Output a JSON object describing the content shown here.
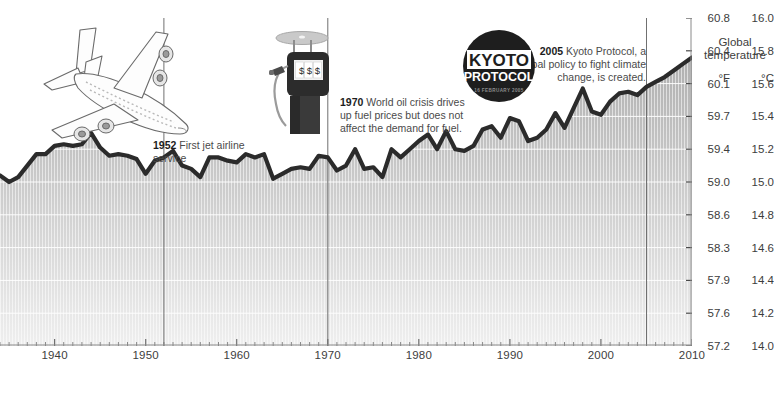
{
  "axis": {
    "header_line1": "Global",
    "header_line2": "temperature",
    "unit_f": "°F",
    "unit_c": "°C",
    "f_labels": [
      "60.8",
      "60.4",
      "60.1",
      "59.7",
      "59.4",
      "59.0",
      "58.6",
      "58.3",
      "57.9",
      "57.6",
      "57.2"
    ],
    "c_labels": [
      "16.0",
      "15.8",
      "15.6",
      "15.4",
      "15.2",
      "15.0",
      "14.8",
      "14.6",
      "14.4",
      "14.2",
      "14.0"
    ],
    "x_labels": [
      "1940",
      "1950",
      "1960",
      "1970",
      "1980",
      "1990",
      "2000",
      "2010"
    ]
  },
  "annotations": [
    {
      "id": "anno-1952",
      "year": "1952",
      "text": " First jet airline service",
      "line_x": 1952
    },
    {
      "id": "anno-1970",
      "year": "1970",
      "text": " World oil crisis drives up fuel prices but does not affect the demand for fuel.",
      "line_x": 1970
    },
    {
      "id": "anno-2005",
      "year": "2005",
      "text": " Kyoto Protocol, a global policy to fight climate change, is created.",
      "line_x": 2005
    }
  ],
  "illustrations": {
    "plane": {
      "name": "airplane-illustration",
      "alt": "jet airliner line drawing"
    },
    "pump": {
      "name": "fuel-pump-illustration",
      "display": "$ $ $"
    },
    "kyoto": {
      "name": "kyoto-protocol-stamp",
      "line1": "KYOTO",
      "line2": "PROTOCOL",
      "line3": "16 FEBRUARY 2005"
    }
  },
  "colors": {
    "line": "#2b2b2b",
    "fill_top": "#b4b4b4",
    "fill_bottom": "#ececec",
    "grid": "#ffffff",
    "callout": "#6e6e6e",
    "text": "#3d3d3d"
  },
  "chart_data": {
    "type": "area",
    "title": "Global temperature",
    "xlabel": "",
    "ylabel": "Global temperature",
    "y_unit_primary": "°F",
    "y_unit_secondary": "°C",
    "xlim": [
      1934,
      2010
    ],
    "ylim_c": [
      14.0,
      16.0
    ],
    "ylim_f": [
      57.2,
      60.8
    ],
    "grid": true,
    "legend": "none",
    "x": [
      1934,
      1935,
      1936,
      1937,
      1938,
      1939,
      1940,
      1941,
      1942,
      1943,
      1944,
      1945,
      1946,
      1947,
      1948,
      1949,
      1950,
      1951,
      1952,
      1953,
      1954,
      1955,
      1956,
      1957,
      1958,
      1959,
      1960,
      1961,
      1962,
      1963,
      1964,
      1965,
      1966,
      1967,
      1968,
      1969,
      1970,
      1971,
      1972,
      1973,
      1974,
      1975,
      1976,
      1977,
      1978,
      1979,
      1980,
      1981,
      1982,
      1983,
      1984,
      1985,
      1986,
      1987,
      1988,
      1989,
      1990,
      1991,
      1992,
      1993,
      1994,
      1995,
      1996,
      1997,
      1998,
      1999,
      2000,
      2001,
      2002,
      2003,
      2004,
      2005,
      2006,
      2007,
      2008,
      2009,
      2010
    ],
    "values_c": [
      15.04,
      15.0,
      15.03,
      15.1,
      15.17,
      15.17,
      15.22,
      15.23,
      15.22,
      15.23,
      15.3,
      15.21,
      15.16,
      15.17,
      15.16,
      15.14,
      15.05,
      15.13,
      15.15,
      15.19,
      15.1,
      15.08,
      15.03,
      15.15,
      15.15,
      15.13,
      15.12,
      15.17,
      15.15,
      15.17,
      15.02,
      15.05,
      15.08,
      15.09,
      15.08,
      15.16,
      15.15,
      15.07,
      15.1,
      15.2,
      15.08,
      15.09,
      15.03,
      15.2,
      15.15,
      15.2,
      15.25,
      15.29,
      15.2,
      15.31,
      15.2,
      15.19,
      15.22,
      15.32,
      15.34,
      15.27,
      15.39,
      15.37,
      15.25,
      15.27,
      15.32,
      15.42,
      15.33,
      15.45,
      15.57,
      15.43,
      15.41,
      15.49,
      15.54,
      15.55,
      15.53,
      15.58,
      15.61,
      15.64,
      15.68,
      15.72,
      15.76
    ],
    "data_points_note": "Annual mean surface temperature anomaly rendered as a filled area; rising trend from ~15.0°C in the 1930s to ~15.8°C by 2010"
  }
}
